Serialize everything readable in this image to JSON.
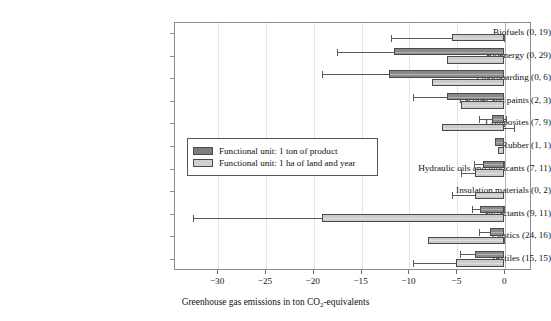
{
  "chart_data": {
    "type": "bar",
    "orientation": "horizontal",
    "title": "",
    "xlabel": "Greenhouse gas emissions in ton CO2-equivalents",
    "xlabel_html": "Greenhouse gas emissions in ton CO<sub>2</sub>-equivalents",
    "ylabel": "",
    "xlim": [
      -34.5,
      2.8
    ],
    "xticks": [
      -30,
      -25,
      -20,
      -15,
      -10,
      -5,
      0
    ],
    "xticklabels": [
      "−30",
      "−25",
      "−20",
      "−15",
      "−10",
      "−5",
      "0"
    ],
    "grid": "vertical",
    "legend_position": "center-left inside axes",
    "categories": [
      "Biofuels (0, 19)",
      "Bioenergy (0, 29)",
      "Floorboarding (0, 6)",
      "Lacquer and paints (2, 3)",
      "Composites (7, 9)",
      "Rubber (1, 1)",
      "Hydraulic oils and lubricants (7, 11)",
      "Insulation materials (0, 2)",
      "Surfactants (9, 11)",
      "Plastics (24, 16)",
      "Textiles (15, 15)"
    ],
    "series": [
      {
        "name": "Functional unit: 1 ton of product",
        "color": "#8a8a8a",
        "values": [
          0,
          -11.5,
          -12.0,
          -6.0,
          -1.3,
          -1.0,
          -2.2,
          0,
          -2.5,
          -1.5,
          -3.0
        ],
        "err_low": [
          0,
          -17.5,
          -19.0,
          -9.5,
          -2.6,
          -1.0,
          -3.2,
          0,
          -3.4,
          -2.6,
          -4.6
        ],
        "err_high": [
          0,
          -11.5,
          -12.0,
          -6.0,
          0.2,
          -1.0,
          -1.6,
          0,
          -1.9,
          -1.5,
          -3.0
        ]
      },
      {
        "name": "Functional unit: 1 ha of land and year",
        "color": "#cccccc",
        "values": [
          -5.5,
          -6.0,
          -7.5,
          -4.5,
          -6.5,
          -0.6,
          -3.0,
          -3.0,
          -19.0,
          -8.0,
          -5.0
        ],
        "err_low": [
          -11.8,
          -6.0,
          -7.5,
          -4.5,
          -6.5,
          -0.6,
          -4.5,
          -5.5,
          -32.5,
          -8.0,
          -9.5
        ],
        "err_high": [
          -5.2,
          -6.0,
          -7.5,
          -4.5,
          1.0,
          -0.6,
          -3.0,
          -3.0,
          -19.0,
          -6.8,
          -5.0
        ]
      }
    ],
    "legend": [
      {
        "label": "Functional unit: 1 ton of product",
        "swatch": "dark"
      },
      {
        "label": "Functional unit: 1 ha of land and year",
        "swatch": "light"
      }
    ]
  }
}
